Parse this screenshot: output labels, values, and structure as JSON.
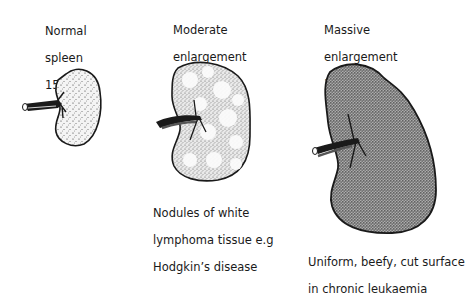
{
  "figure": {
    "panels": [
      {
        "id": "normal",
        "title_lines": [
          "Normal",
          "spleen",
          "150 g"
        ],
        "caption_lines": []
      },
      {
        "id": "moderate",
        "title_lines": [
          "Moderate",
          "enlargement",
          "500 g"
        ],
        "caption_lines": [
          "Nodules of white",
          "lymphoma tissue e.g",
          "Hodgkin’s disease"
        ]
      },
      {
        "id": "massive",
        "title_lines": [
          "Massive",
          "enlargement",
          "1500 g"
        ],
        "caption_lines": [
          "Uniform, beefy, cut surface",
          "in chronic leukaemia"
        ]
      }
    ],
    "colors": {
      "outline": "#1a1a1a",
      "normal_fill": "#f2f2f2",
      "moderate_fill": "#e6e6e6",
      "massive_fill": "#8a8a8a",
      "nodule": "#fbfbfb"
    }
  }
}
